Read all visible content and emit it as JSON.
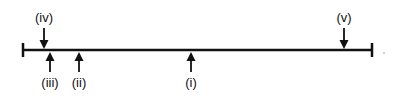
{
  "diagram": {
    "type": "number-line",
    "line": {
      "x_start": 23,
      "x_end": 372,
      "y": 50,
      "color": "#111111"
    },
    "markers_above": [
      {
        "label": "(iv)",
        "x": 44
      },
      {
        "label": "(v)",
        "x": 344
      }
    ],
    "markers_below": [
      {
        "label": "(iii)",
        "x": 50
      },
      {
        "label": "(ii)",
        "x": 79
      },
      {
        "label": "(i)",
        "x": 191
      }
    ]
  }
}
